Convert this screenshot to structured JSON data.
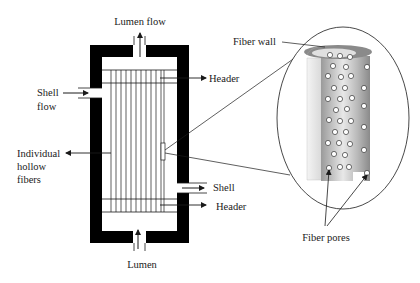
{
  "diagram": {
    "type": "hollow-fiber-membrane-module",
    "labels": {
      "lumen_flow": "Lumen flow",
      "header_top": "Header",
      "shell_flow_line1": "Shell",
      "shell_flow_line2": "flow",
      "individual_line1": "Individual",
      "individual_line2": "hollow",
      "individual_line3": "fibers",
      "shell_out": "Shell",
      "header_bottom": "Header",
      "lumen": "Lumen",
      "fiber_wall": "Fiber wall",
      "fiber_pores": "Fiber pores"
    },
    "colors": {
      "shell": "#000000",
      "line": "#1a1a1a",
      "fiber_dark": "#8c8c8c",
      "fiber_light": "#e6e6e6",
      "pore": "#ffffff"
    },
    "fiber_count": 12
  }
}
